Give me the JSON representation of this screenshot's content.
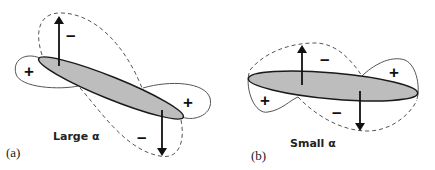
{
  "figure": {
    "panels": [
      {
        "id": "a",
        "label": "(a)",
        "caption": "Large α",
        "signs": {
          "left_lobe": "+",
          "right_lobe": "+",
          "upper_dashed_lobe": "–",
          "lower_dashed_lobe": "–"
        },
        "arrows": [
          "up",
          "down"
        ]
      },
      {
        "id": "b",
        "label": "(b)",
        "caption": "Small α",
        "signs": {
          "left_lobe": "+",
          "right_lobe": "+",
          "upper_dashed_lobe": "–",
          "lower_dashed_lobe": "–"
        },
        "arrows": [
          "up",
          "down"
        ]
      }
    ],
    "colors": {
      "ellipse_fill": "#bdbdbd",
      "ellipse_stroke": "#1a1a1a",
      "solid_lobe_stroke": "#555555",
      "dashed_lobe_stroke": "#555555",
      "arrow": "#111111",
      "background": "#ffffff"
    }
  }
}
